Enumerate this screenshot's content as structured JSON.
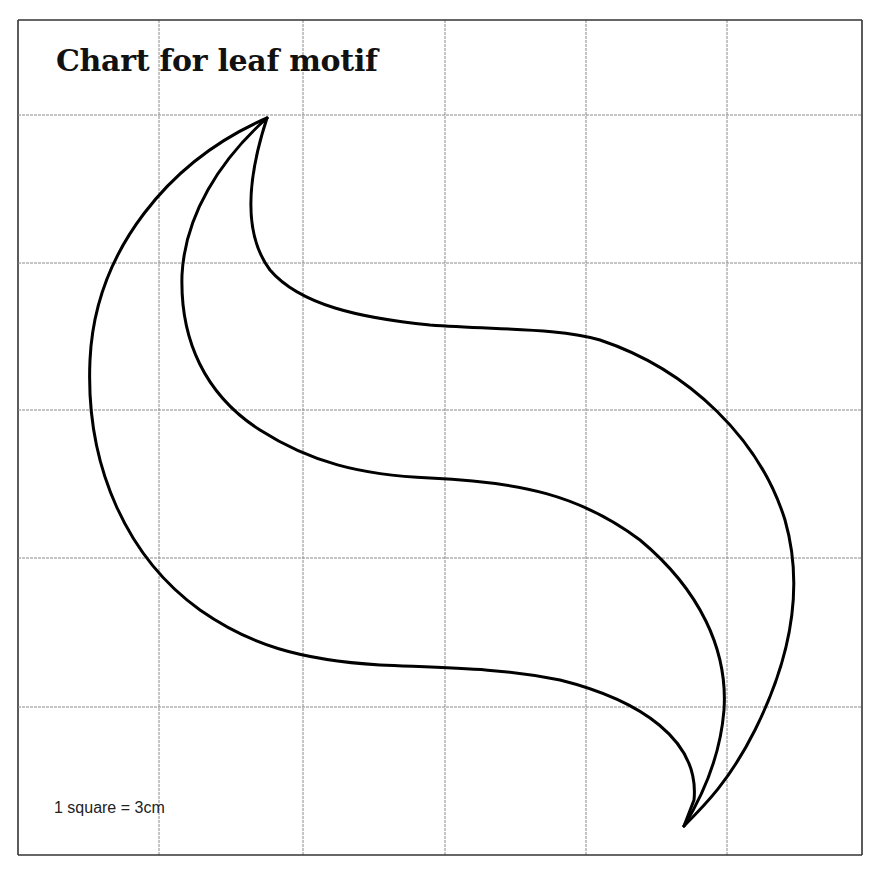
{
  "title": "Chart for leaf motif",
  "scale_note": "1 square = 3cm",
  "grid": {
    "columns": 6,
    "rows": 6,
    "x_lines": [
      18,
      159,
      303,
      445,
      586,
      727,
      862
    ],
    "y_lines": [
      20,
      115,
      263,
      410,
      558,
      707,
      855
    ],
    "line_color": "#8a8a8a",
    "border_color": "#333333"
  },
  "motif": {
    "stroke_color": "#000000",
    "curves": [
      {
        "name": "outer-edge",
        "d": "M267,118 C170,160 95,250 90,360 C85,470 130,560 200,610 C250,645 300,660 380,665 C450,668 500,668 560,680 C640,700 700,740 694,800 L684,826"
      },
      {
        "name": "middle-vein",
        "d": "M267,118 C220,160 185,215 182,275 C180,340 205,395 260,430 C310,462 360,475 430,478 C520,482 580,495 640,540 C700,590 728,650 724,710 C720,760 700,800 684,826"
      },
      {
        "name": "inner-edge",
        "d": "M267,118 C250,170 240,230 270,270 C300,305 360,318 430,325 C500,330 560,328 600,340 C690,370 760,440 785,520 C805,590 790,660 755,730 C730,780 705,805 684,826"
      }
    ]
  }
}
